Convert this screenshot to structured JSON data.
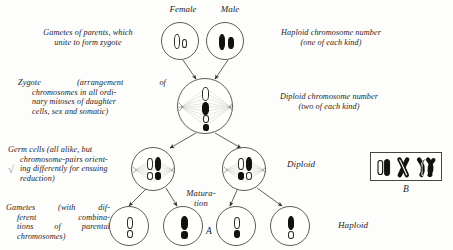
{
  "figure": {
    "title_left": "Gametes of parents, which unite to form zygote",
    "headers": {
      "female": "Female",
      "male": "Male"
    },
    "captions": {
      "gametes_parents": "Gametes of parents, which unite to form zygote",
      "haploid_number": "Haploid chromosome number (one of each kind)",
      "zygote": "Zygote (arrangement of chromosomes in all ordinary mitoses of daughter cells, sex and somatic)",
      "diploid_number": "Diploid chromosome number (two of each kind)",
      "germ_cells": "Germ cells (all alike, but chromosome-pairs orienting differently for ensuing reduction)",
      "diploid": "Diploid",
      "maturation": "Matura- tion",
      "gametes_different": "Gametes (with different combinations of parental chromosomes)",
      "haploid": "Haploid"
    },
    "caption_lines": {
      "gametes_parents": [
        "Gametes of parents, which",
        "unite to form zygote"
      ],
      "haploid_number": [
        "Haploid chromosome number",
        "(one of each kind)"
      ],
      "zygote": [
        "Zygote    (arrangement    of",
        "chromosomes in all ordi-",
        "nary mitoses of daughter",
        "cells, sex and somatic)"
      ],
      "diploid_number": [
        "Diploid chromosome number",
        "(two of each kind)"
      ],
      "germ_cells": [
        "Germ cells (all alike, but",
        "chromosome-pairs orient-",
        "ing differently for ensuing",
        "reduction)"
      ],
      "gametes_different": [
        "Gametes  (with  dif-",
        "ferent      combina-",
        "tions  of  parental",
        "chromosomes)"
      ],
      "maturation": [
        "Matura-",
        "tion"
      ]
    },
    "panel_labels": {
      "a": "A",
      "b": "B"
    },
    "margin_mark": "√",
    "cells": [
      {
        "id": "female-gamete",
        "name": "female-gamete-cell",
        "chromosomes": [
          {
            "kind": "white",
            "size": "large"
          },
          {
            "kind": "white",
            "size": "small"
          }
        ]
      },
      {
        "id": "male-gamete",
        "name": "male-gamete-cell",
        "chromosomes": [
          {
            "kind": "black",
            "size": "large"
          },
          {
            "kind": "black",
            "size": "small"
          }
        ]
      },
      {
        "id": "zygote",
        "name": "zygote-cell",
        "chromosomes": [
          {
            "kind": "white",
            "size": "large"
          },
          {
            "kind": "black",
            "size": "large"
          },
          {
            "kind": "white",
            "size": "small"
          },
          {
            "kind": "black",
            "size": "small"
          }
        ]
      },
      {
        "id": "germ-cell-left",
        "name": "germ-cell-left",
        "chromosomes": [
          {
            "kind": "white",
            "size": "large"
          },
          {
            "kind": "black",
            "size": "large"
          },
          {
            "kind": "white",
            "size": "small"
          },
          {
            "kind": "black",
            "size": "small"
          }
        ]
      },
      {
        "id": "germ-cell-right",
        "name": "germ-cell-right",
        "chromosomes": [
          {
            "kind": "white",
            "size": "large"
          },
          {
            "kind": "black",
            "size": "large"
          },
          {
            "kind": "black",
            "size": "small"
          },
          {
            "kind": "white",
            "size": "small"
          }
        ]
      },
      {
        "id": "gamete-1",
        "name": "gamete-cell-1",
        "chromosomes": [
          {
            "kind": "white",
            "size": "large"
          },
          {
            "kind": "white",
            "size": "small"
          }
        ]
      },
      {
        "id": "gamete-2",
        "name": "gamete-cell-2",
        "chromosomes": [
          {
            "kind": "black",
            "size": "large"
          },
          {
            "kind": "black",
            "size": "small"
          }
        ]
      },
      {
        "id": "gamete-3",
        "name": "gamete-cell-3",
        "chromosomes": [
          {
            "kind": "white",
            "size": "large"
          },
          {
            "kind": "black",
            "size": "small"
          }
        ]
      },
      {
        "id": "gamete-4",
        "name": "gamete-cell-4",
        "chromosomes": [
          {
            "kind": "black",
            "size": "large"
          },
          {
            "kind": "white",
            "size": "small"
          }
        ]
      }
    ],
    "inset_b": {
      "figures": [
        "paired-chromosomes",
        "crossed-chromosomes-x",
        "crossed-chromosomes-double"
      ]
    },
    "colors": {
      "ink": "#1d1d1d",
      "outline": "#5c5c56",
      "chromosome_dark": "#111110",
      "chromosome_light": "#fffffe",
      "spindle": "#b9b9b3",
      "paper": "#fdfdfb",
      "margin_mark": "#8d9a8d"
    }
  }
}
